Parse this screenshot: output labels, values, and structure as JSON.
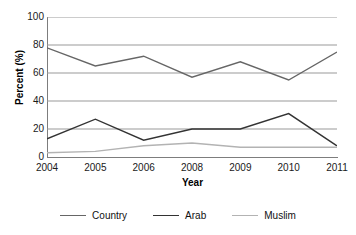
{
  "chart_data": {
    "type": "line",
    "title": "",
    "xlabel": "Year",
    "ylabel": "Percent (%)",
    "categories": [
      "2004",
      "2005",
      "2006",
      "2008",
      "2009",
      "2010",
      "2011"
    ],
    "x_tick_labels": [
      "2004",
      "2005",
      "2006",
      "2008",
      "2009",
      "2010",
      "2011"
    ],
    "y_tick_labels": [
      "100",
      "80",
      "60",
      "40",
      "20",
      "0"
    ],
    "y_ticks": [
      100,
      80,
      60,
      40,
      20,
      0
    ],
    "ylim": [
      0,
      100
    ],
    "grid": "horizontal",
    "legend_position": "bottom",
    "series": [
      {
        "name": "Country",
        "color": "#666666",
        "values": [
          78,
          65,
          72,
          57,
          68,
          55,
          75
        ]
      },
      {
        "name": "Arab",
        "color": "#333333",
        "values": [
          13,
          27,
          12,
          20,
          20,
          31,
          8
        ]
      },
      {
        "name": "Muslim",
        "color": "#b3b3b3",
        "values": [
          3,
          4,
          8,
          10,
          7,
          7,
          7
        ]
      }
    ]
  },
  "axes": {
    "y_title": "Percent (%)",
    "x_title": "Year"
  },
  "legend": {
    "items": [
      {
        "label": "Country",
        "color": "#666666"
      },
      {
        "label": "Arab",
        "color": "#333333"
      },
      {
        "label": "Muslim",
        "color": "#b3b3b3"
      }
    ]
  },
  "colors": {
    "axis": "#7d7d7d",
    "gridline": "#999999",
    "background": "#ffffff",
    "text": "#111111"
  }
}
